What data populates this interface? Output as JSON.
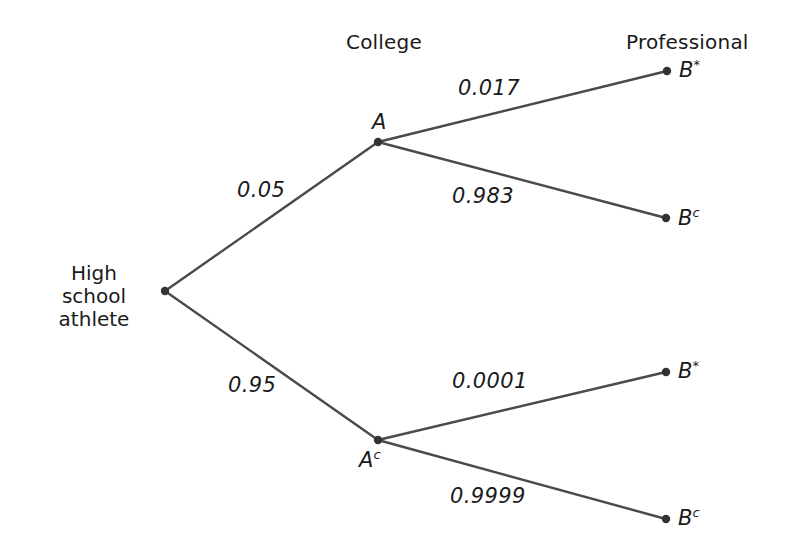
{
  "diagram": {
    "background_color": "#ffffff",
    "line_color": "#4a4a4a",
    "node_color": "#333333",
    "text_color": "#1a1a1a"
  },
  "headers": [
    {
      "id": "college",
      "label": "College",
      "x": 346,
      "y": 32
    },
    {
      "id": "professional",
      "label": "Professional",
      "x": 626,
      "y": 32
    }
  ],
  "nodes": [
    {
      "id": "root",
      "label_line1": "High school",
      "label_line2": "athlete",
      "x": 165,
      "y": 291,
      "label_x": 38,
      "label_y": 262
    },
    {
      "id": "a",
      "label": "A",
      "superscript": "",
      "x": 378,
      "y": 142,
      "label_x": 372,
      "label_y": 112
    },
    {
      "id": "ac",
      "label": "A",
      "superscript": "c",
      "x": 378,
      "y": 440,
      "label_x": 359,
      "label_y": 450
    },
    {
      "id": "b_star_top",
      "label": "B",
      "superscript": "*",
      "x": 667,
      "y": 71,
      "label_x": 679,
      "label_y": 60
    },
    {
      "id": "bc_top",
      "label": "B",
      "superscript": "c",
      "x": 666,
      "y": 218,
      "label_x": 678,
      "label_y": 208
    },
    {
      "id": "b_star_bottom",
      "label": "B",
      "superscript": "*",
      "x": 666,
      "y": 372,
      "label_x": 678,
      "label_y": 361
    },
    {
      "id": "bc_bottom",
      "label": "B",
      "superscript": "c",
      "x": 666,
      "y": 519,
      "label_x": 678,
      "label_y": 508
    }
  ],
  "edges": [
    {
      "id": "root-to-a",
      "from": "root",
      "to": "a",
      "probability": "0.05",
      "label_x": 237,
      "label_y": 180
    },
    {
      "id": "root-to-ac",
      "from": "root",
      "to": "ac",
      "probability": "0.95",
      "label_x": 228,
      "label_y": 375
    },
    {
      "id": "a-to-bstar",
      "from": "a",
      "to": "b_star_top",
      "probability": "0.017",
      "label_x": 458,
      "label_y": 78
    },
    {
      "id": "a-to-bc",
      "from": "a",
      "to": "bc_top",
      "probability": "0.983",
      "label_x": 452,
      "label_y": 186
    },
    {
      "id": "ac-to-bstar",
      "from": "ac",
      "to": "b_star_bottom",
      "probability": "0.0001",
      "label_x": 452,
      "label_y": 371
    },
    {
      "id": "ac-to-bc",
      "from": "ac",
      "to": "bc_bottom",
      "probability": "0.9999",
      "label_x": 450,
      "label_y": 486
    }
  ],
  "chart_data": {
    "type": "diagram",
    "stages": [
      "High school athlete",
      "College",
      "Professional"
    ],
    "branches": [
      {
        "path": [
          "High school athlete",
          "A",
          "B*"
        ],
        "probabilities": [
          0.05,
          0.017
        ]
      },
      {
        "path": [
          "High school athlete",
          "A",
          "Bc"
        ],
        "probabilities": [
          0.05,
          0.983
        ]
      },
      {
        "path": [
          "High school athlete",
          "Ac",
          "B*"
        ],
        "probabilities": [
          0.95,
          0.0001
        ]
      },
      {
        "path": [
          "High school athlete",
          "Ac",
          "Bc"
        ],
        "probabilities": [
          0.95,
          0.9999
        ]
      }
    ]
  }
}
